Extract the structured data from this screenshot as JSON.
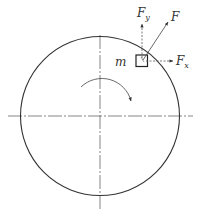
{
  "diagram": {
    "type": "rotating-disk-force-decomposition",
    "labels": {
      "mass": "m",
      "force": "F",
      "force_x": "F",
      "force_x_sub": "x",
      "force_y": "F",
      "force_y_sub": "y"
    },
    "rotation_direction": "clockwise",
    "colors": {
      "line": "#333333",
      "axis": "#555555",
      "background": "#ffffff"
    }
  }
}
